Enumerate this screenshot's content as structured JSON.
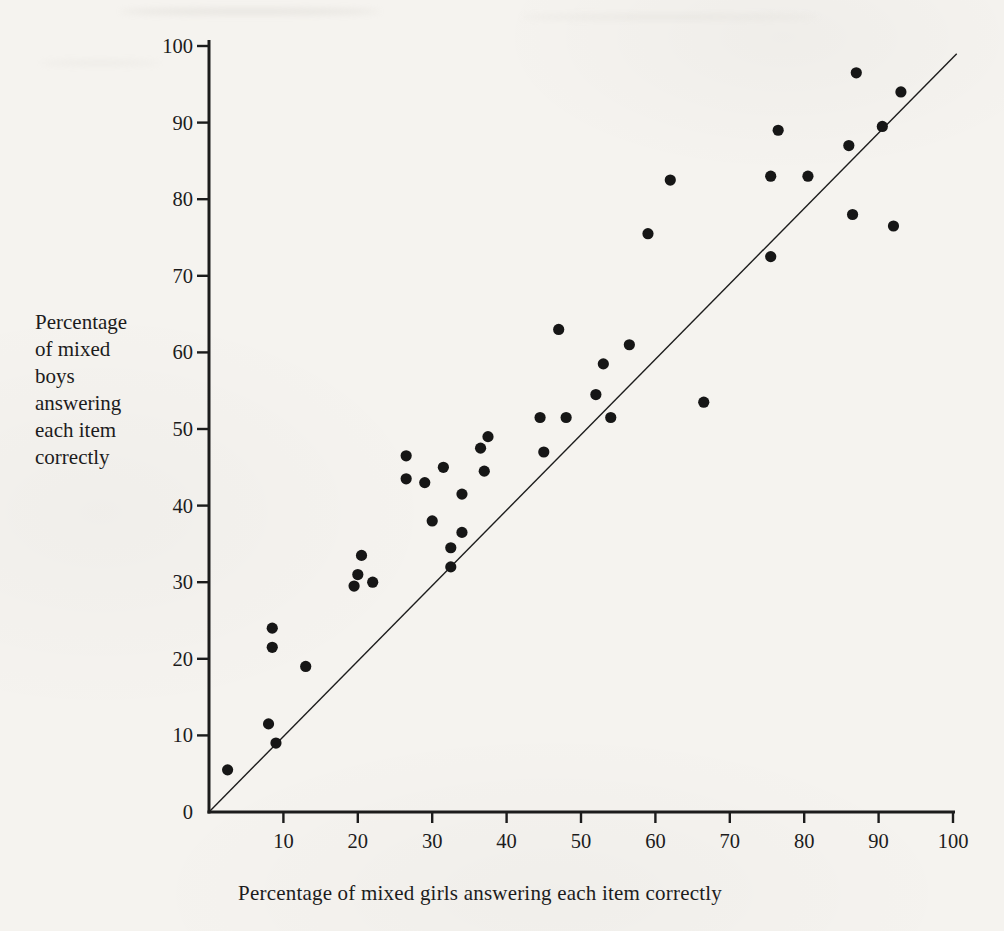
{
  "page": {
    "kind": "scanned book figure",
    "paper_color": "#f5f3ef",
    "ink_color": "#1c1c1c"
  },
  "chart_data": {
    "type": "scatter",
    "xlabel": "Percentage of mixed girls answering each item correctly",
    "ylabel": "Percentage of mixed boys answering each item correctly",
    "ylabel_lines": [
      "Percentage",
      "of mixed",
      "boys",
      "answering",
      "each item",
      "correctly"
    ],
    "xlim": [
      0,
      100
    ],
    "ylim": [
      0,
      100
    ],
    "xticks": [
      10,
      20,
      30,
      40,
      50,
      60,
      70,
      80,
      90,
      100
    ],
    "yticks": [
      0,
      10,
      20,
      30,
      40,
      50,
      60,
      70,
      80,
      90,
      100
    ],
    "grid": false,
    "legend": false,
    "marker": {
      "shape": "circle",
      "radius_px": 5.6,
      "color": "#161616"
    },
    "reference_line": {
      "x1": 0,
      "y1": 0,
      "x2": 100.5,
      "y2": 99
    },
    "points": [
      [
        2.5,
        5.5
      ],
      [
        9,
        9
      ],
      [
        8,
        11.5
      ],
      [
        13,
        19
      ],
      [
        8.5,
        21.5
      ],
      [
        8.5,
        24
      ],
      [
        19.5,
        29.5
      ],
      [
        20,
        31
      ],
      [
        22,
        30
      ],
      [
        20.5,
        33.5
      ],
      [
        26.5,
        46.5
      ],
      [
        26.5,
        43.5
      ],
      [
        29,
        43
      ],
      [
        31.5,
        45
      ],
      [
        30,
        38
      ],
      [
        34,
        41.5
      ],
      [
        34,
        36.5
      ],
      [
        32.5,
        34.5
      ],
      [
        32.5,
        32
      ],
      [
        36.5,
        47.5
      ],
      [
        37.5,
        49
      ],
      [
        37,
        44.5
      ],
      [
        44.5,
        51.5
      ],
      [
        45,
        47
      ],
      [
        48,
        51.5
      ],
      [
        47,
        63
      ],
      [
        52,
        54.5
      ],
      [
        53,
        58.5
      ],
      [
        54,
        51.5
      ],
      [
        56.5,
        61
      ],
      [
        66.5,
        53.5
      ],
      [
        59,
        75.5
      ],
      [
        62,
        82.5
      ],
      [
        75.5,
        72.5
      ],
      [
        75.5,
        83
      ],
      [
        76.5,
        89
      ],
      [
        80.5,
        83
      ],
      [
        86,
        87
      ],
      [
        86.5,
        78
      ],
      [
        87,
        96.5
      ],
      [
        90.5,
        89.5
      ],
      [
        92,
        76.5
      ],
      [
        93,
        94
      ]
    ]
  }
}
